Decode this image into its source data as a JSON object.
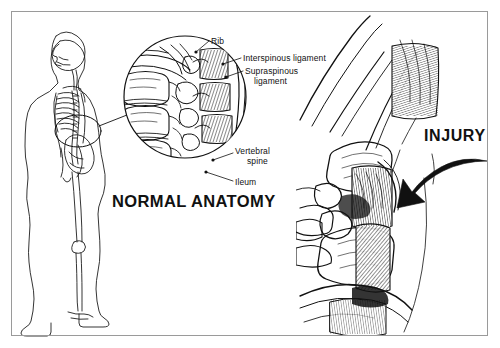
{
  "figure": {
    "kind": "medical-illustration",
    "background_color": "#ffffff",
    "ink_color": "#111111",
    "frame_color": "#9a9a9a"
  },
  "panels": {
    "orientation": {
      "name": "whole-body-lateral-skeleton",
      "description": "Lateral view line drawing of a standing human body with skeleton visible; an oval highlight marks the lower lumbar region, joined by a leader line to the magnified circular inset."
    },
    "inset": {
      "name": "normal-anatomy-circle-inset",
      "caption": "NORMAL ANATOMY",
      "description": "Circular magnified cutaway of normal lumbar vertebrae, rib, and intact ligaments."
    },
    "injury": {
      "name": "injury-panel",
      "caption": "INJURY",
      "description": "Large cutaway of the same vertebral region showing torn ligaments and disrupted joint, indicated by a heavy curved black arrow."
    }
  },
  "labels": [
    {
      "id": "rib",
      "text": "Rib"
    },
    {
      "id": "interspinous",
      "text": "Interspinous ligament"
    },
    {
      "id": "supraspinous_line1",
      "text": "Supraspinous"
    },
    {
      "id": "supraspinous_line2",
      "text": "ligament"
    },
    {
      "id": "vertebral_line1",
      "text": "Vertebral"
    },
    {
      "id": "vertebral_line2",
      "text": "spine"
    },
    {
      "id": "ileum",
      "text": "Ileum"
    }
  ],
  "captions": {
    "normal_anatomy": "NORMAL ANATOMY",
    "injury": "INJURY"
  },
  "annotations": {
    "injury_arrow": "curved-black-arrow-pointing-down-left"
  }
}
